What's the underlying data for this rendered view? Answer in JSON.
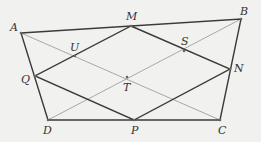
{
  "figure": {
    "colors": {
      "thick": "#3a3a3a",
      "thin": "#a8a8a8",
      "label": "#333333"
    },
    "points": {
      "A": {
        "label": "A",
        "x": 21,
        "y": 33,
        "lx": 10,
        "ly": 31
      },
      "B": {
        "label": "B",
        "x": 241,
        "y": 19,
        "lx": 240,
        "ly": 15
      },
      "M": {
        "label": "M",
        "x": 131,
        "y": 26,
        "lx": 126,
        "ly": 20
      },
      "N": {
        "label": "N",
        "x": 230,
        "y": 69,
        "lx": 234,
        "ly": 72
      },
      "C": {
        "label": "C",
        "x": 220,
        "y": 120,
        "lx": 218,
        "ly": 134
      },
      "P": {
        "label": "P",
        "x": 134,
        "y": 120,
        "lx": 131,
        "ly": 134
      },
      "D": {
        "label": "D",
        "x": 48,
        "y": 120,
        "lx": 43,
        "ly": 134
      },
      "Q": {
        "label": "Q",
        "x": 35,
        "y": 76,
        "lx": 21,
        "ly": 83
      },
      "T": {
        "label": "T",
        "x": 127,
        "y": 77,
        "lx": 123,
        "ly": 91
      },
      "U": {
        "label": "U",
        "x": 75,
        "y": 56,
        "lx": 70,
        "ly": 51
      },
      "S": {
        "label": "S",
        "x": 184,
        "y": 51,
        "lx": 181,
        "ly": 45
      }
    }
  }
}
